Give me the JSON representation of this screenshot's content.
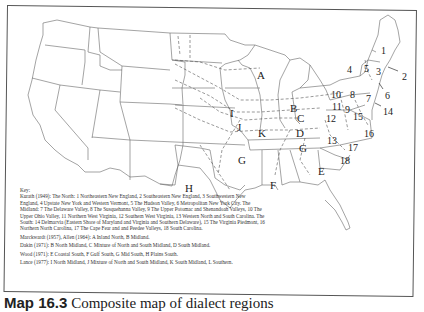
{
  "caption": {
    "number": "Map 16.3",
    "title": "Composite map of dialect regions"
  },
  "map": {
    "region_letters": [
      {
        "id": "A",
        "x": 257,
        "y": 70
      },
      {
        "id": "B",
        "x": 290,
        "y": 103
      },
      {
        "id": "C",
        "x": 297,
        "y": 113
      },
      {
        "id": "D",
        "x": 296,
        "y": 128
      },
      {
        "id": "E",
        "x": 318,
        "y": 166
      },
      {
        "id": "F",
        "x": 270,
        "y": 180
      },
      {
        "id": "G",
        "x": 238,
        "y": 155
      },
      {
        "id": "G",
        "x": 299,
        "y": 143
      },
      {
        "id": "H",
        "x": 185,
        "y": 183
      },
      {
        "id": "I",
        "x": 230,
        "y": 108
      },
      {
        "id": "J",
        "x": 237,
        "y": 122
      },
      {
        "id": "K",
        "x": 258,
        "y": 128
      }
    ],
    "region_numbers": [
      {
        "id": "1",
        "x": 381,
        "y": 46
      },
      {
        "id": "2",
        "x": 402,
        "y": 72
      },
      {
        "id": "3",
        "x": 376,
        "y": 67
      },
      {
        "id": "4",
        "x": 347,
        "y": 65
      },
      {
        "id": "5",
        "x": 364,
        "y": 64
      },
      {
        "id": "6",
        "x": 385,
        "y": 91
      },
      {
        "id": "7",
        "x": 366,
        "y": 94
      },
      {
        "id": "8",
        "x": 350,
        "y": 90
      },
      {
        "id": "9",
        "x": 345,
        "y": 105
      },
      {
        "id": "10",
        "x": 331,
        "y": 90
      },
      {
        "id": "11",
        "x": 332,
        "y": 102
      },
      {
        "id": "12",
        "x": 326,
        "y": 114
      },
      {
        "id": "13",
        "x": 327,
        "y": 136
      },
      {
        "id": "14",
        "x": 383,
        "y": 107
      },
      {
        "id": "15",
        "x": 353,
        "y": 112
      },
      {
        "id": "16",
        "x": 364,
        "y": 129
      },
      {
        "id": "17",
        "x": 348,
        "y": 143
      },
      {
        "id": "18",
        "x": 340,
        "y": 156
      }
    ]
  },
  "key": {
    "heading": "Key:",
    "kurath": "Kurath (1949): The North: 1 Northeastern New England, 2 Southeastern New England, 3 Southwestern New England, 4 Upstate New York and Western Vermont, 5 The Hudson Valley, 6 Metropolitan New York City. The Midland: 7 The Delaware Valley, 8 The Susquehanna Valley, 9 The Upper Potomac and Shenandoah Valleys, 10 The Upper Ohio Valley, 11 Northern West Virginia, 12 Southern West Virginia, 13 Western North and South Carolina. The South: 14 Delmarvia (Eastern Shore of Maryland and Virginia and Southern Delaware), 15 The Virginia Piedmont, 16 Northern North Carolina, 17 The Cape Fear and and Peedee Valleys, 18 South Carolina.",
    "marckwardt": "Marckwardt (1957), Allen (1964): A Inland North, B Midland.",
    "dakin": "Dakin (1971): B North Midland, C Mixture of North and South Midland, D South Midland.",
    "wood": "Wood (1971): E Coastal South, F Gulf South, G Mid South, H Plains South.",
    "lance": "Lance (1977): I North Midland, J Mixture of North and South Midland, K South Midland, L Southern."
  }
}
